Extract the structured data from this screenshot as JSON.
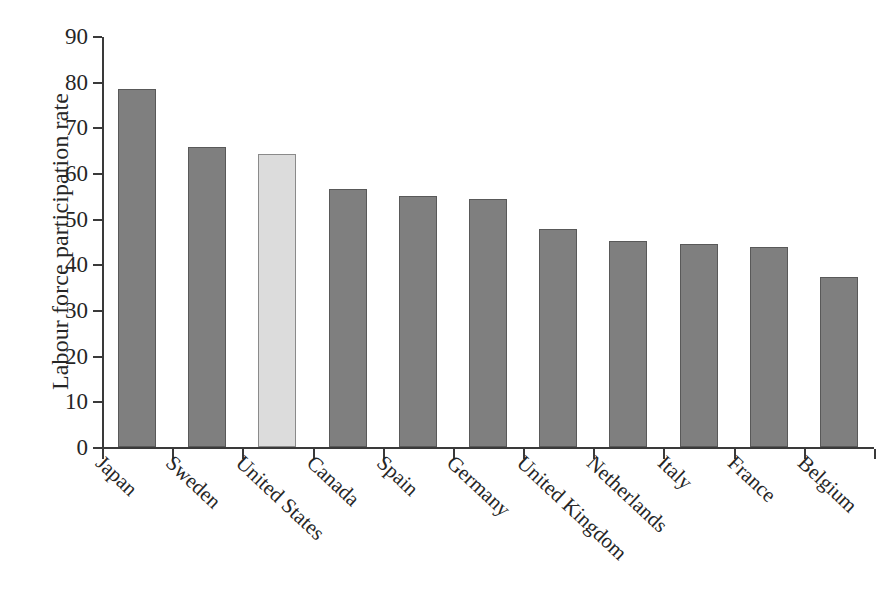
{
  "chart_data": {
    "type": "bar",
    "title": "",
    "subtitle": "",
    "xlabel": "",
    "ylabel": "Labour force participation rate",
    "ylim": [
      0,
      90
    ],
    "ytick_step": 10,
    "yticks": [
      90,
      80,
      70,
      60,
      50,
      40,
      30,
      20,
      10,
      0
    ],
    "grid": false,
    "legend": "none",
    "categories": [
      "Japan",
      "Sweden",
      "United States",
      "Canada",
      "Spain",
      "Germany",
      "United Kingdom",
      "Netherlands",
      "Italy",
      "France",
      "Belgium"
    ],
    "values": [
      78.3,
      65.8,
      64.1,
      56.4,
      54.9,
      54.3,
      47.7,
      45.1,
      44.5,
      43.9,
      37.2
    ],
    "highlighted_category": "United States",
    "bar_colors": [
      "#7f7f7f",
      "#7f7f7f",
      "#dcdcdc",
      "#7f7f7f",
      "#7f7f7f",
      "#7f7f7f",
      "#7f7f7f",
      "#7f7f7f",
      "#7f7f7f",
      "#7f7f7f",
      "#7f7f7f"
    ],
    "bar_border_color": "#595959",
    "axis_color": "#3a3a3a",
    "text_color": "#262626",
    "background": "#ffffff"
  }
}
